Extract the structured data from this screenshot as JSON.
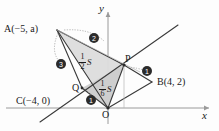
{
  "figure": {
    "axes": {
      "x_label": "x",
      "y_label": "y",
      "origin_label": "O"
    },
    "points": [
      {
        "id": "A",
        "label": "A(−5, a)",
        "px": 57,
        "py": 30
      },
      {
        "id": "B",
        "label": "B(4, 2)",
        "px": 152,
        "py": 82
      },
      {
        "id": "C",
        "label": "C(−4, 0)",
        "px": 55,
        "py": 108
      },
      {
        "id": "P",
        "label": "P",
        "px": 124,
        "py": 65
      },
      {
        "id": "Q",
        "label": "Q",
        "px": 82,
        "py": 88
      },
      {
        "id": "O",
        "label": "O",
        "px": 108,
        "py": 108
      }
    ],
    "area_labels": [
      {
        "id": "half-s",
        "numerator": "1",
        "denominator": "2",
        "suffix": "S"
      },
      {
        "id": "sixth-s",
        "numerator": "1",
        "denominator": "6",
        "suffix": "S"
      }
    ],
    "ratio_markers": [
      {
        "id": "marker-top",
        "value": "2"
      },
      {
        "id": "marker-left",
        "value": "3"
      },
      {
        "id": "marker-right",
        "value": "1"
      },
      {
        "id": "marker-bottom",
        "value": "1"
      }
    ],
    "colors": {
      "line": "#3a3a3a",
      "shade": "#d9d9d9",
      "shade_dark": "#c6c6c6",
      "axis": "#8c8c8c",
      "marker_fill": "#2b2b2b",
      "marker_text": "#ffffff",
      "text": "#1a1a1a"
    }
  }
}
